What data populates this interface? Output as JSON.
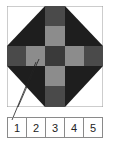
{
  "diagram": {
    "colors": {
      "background": "#ffffff",
      "black": "#1e1e1e",
      "dark_gray": "#4a4a4a",
      "center": "#3a3a3a",
      "light_gray": "#8c8c8c",
      "frame": "#9a9a9a"
    },
    "pointer": {
      "from_cell": "1",
      "to": "light-gray square left of center"
    }
  },
  "key": {
    "cells": [
      {
        "label": "1"
      },
      {
        "label": "2"
      },
      {
        "label": "3"
      },
      {
        "label": "4"
      },
      {
        "label": "5"
      }
    ]
  }
}
